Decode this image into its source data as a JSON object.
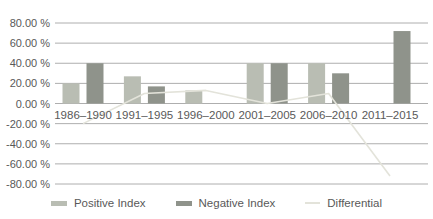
{
  "chart_data": {
    "type": "bar",
    "title": "",
    "xlabel": "",
    "ylabel": "",
    "categories": [
      "1986–1990",
      "1991–1995",
      "1996–2000",
      "2001–2005",
      "2006–2010",
      "2011–2015"
    ],
    "series": [
      {
        "name": "Positive Index",
        "type": "bar",
        "color": "#b9bdb3",
        "values": [
          20,
          27,
          13,
          40,
          40,
          0
        ]
      },
      {
        "name": "Negative Index",
        "type": "bar",
        "color": "#8f938b",
        "values": [
          40,
          17,
          0,
          40,
          30,
          72
        ]
      },
      {
        "name": "Differential",
        "type": "line",
        "color": "#e3e3da",
        "values": [
          -20,
          10,
          13,
          0,
          10,
          -72
        ]
      }
    ],
    "ylim": [
      -80,
      80
    ],
    "ytick_step": 20,
    "yticks": [
      "80.00 %",
      "60.00 %",
      "40.00 %",
      "20.00 %",
      "0.00 %",
      "-20.00 %",
      "-40.00 %",
      "-60.00 %",
      "-80.00 %"
    ],
    "grid": true,
    "legend_position": "bottom"
  },
  "style": {
    "gridline_color": "#aeaeae",
    "axis_text_color": "#595959",
    "background_color": "#ffffff"
  }
}
